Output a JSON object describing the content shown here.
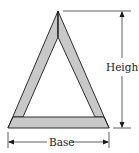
{
  "diagram": {
    "type": "triangle-frame",
    "labels": {
      "height": "Height",
      "base": "Base"
    },
    "colors": {
      "frame_fill": "#c8c8c8",
      "stroke": "#1a1a1a",
      "background": "#ffffff"
    },
    "geometry": {
      "outer_apex": [
        58,
        11
      ],
      "outer_base_left": [
        8,
        128
      ],
      "outer_base_right": [
        109,
        128
      ],
      "inner_apex": [
        58,
        37
      ],
      "inner_base_left": [
        23,
        117
      ],
      "inner_base_right": [
        95,
        117
      ],
      "base_bar_top_y": 117
    }
  }
}
